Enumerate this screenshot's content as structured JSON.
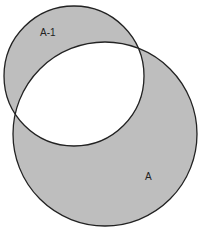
{
  "diagram": {
    "type": "venn-symmetric-difference",
    "fill_color": "#bebebe",
    "stroke_color": "#222222",
    "background": "#ffffff",
    "sets": [
      {
        "label": "A-1",
        "cx": 74,
        "cy": 76,
        "r": 70,
        "label_x": 40,
        "label_y": 36
      },
      {
        "label": "A",
        "cx": 105,
        "cy": 134,
        "r": 92,
        "label_x": 145,
        "label_y": 180
      }
    ],
    "intersection_fill": "#ffffff"
  }
}
